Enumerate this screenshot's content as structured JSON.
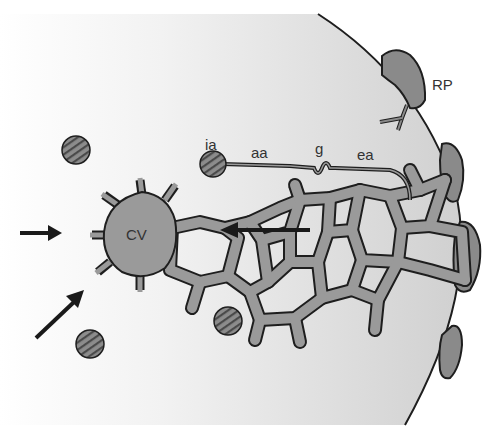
{
  "diagram": {
    "type": "liver lobule sinusoidal network schematic",
    "labels": {
      "ia": "ia",
      "aa": "aa",
      "g": "g",
      "ea": "ea",
      "cv": "CV",
      "rp": "RP"
    },
    "colors": {
      "background": "#ffffff",
      "lobule_fill_light": "#f7f7f7",
      "lobule_fill_dark": "#d2d2d2",
      "sinusoid_fill": "#9a9a9a",
      "outline": "#1e1e1e",
      "portal_fill": "#8a8a8a",
      "arteriole_fill": "#777777",
      "arrow": "#1a1a1a"
    },
    "arrows": [
      {
        "id": "left-horizontal",
        "direction": "right"
      },
      {
        "id": "left-diagonal",
        "direction": "up-right"
      },
      {
        "id": "sinusoid-flow",
        "direction": "left"
      }
    ]
  }
}
